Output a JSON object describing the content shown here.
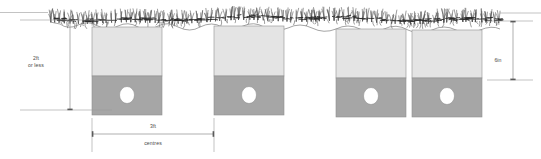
{
  "diagram": {
    "canvas": {
      "width": 541,
      "height": 159,
      "background": "#ffffff"
    },
    "colors": {
      "block_upper": "#e4e4e4",
      "block_lower": "#a6a6a6",
      "bore_fill": "#ffffff",
      "outline": "#8f8f8f",
      "dimension_line": "#8c8c8c",
      "tick": "#5a5a5a",
      "label_text": "#4a4a4a",
      "hedge_light": "#4d4d4d",
      "hedge_dark": "#2b2b2b",
      "ground_line": "#7d7d7d"
    },
    "dimensions": [
      {
        "id": "height-left",
        "label_line_1": "2ft",
        "label_line_2": "or less",
        "orientation": "vertical",
        "x": 70,
        "y_top": 20,
        "y_bottom": 110,
        "label_x": 36,
        "label_y": 60,
        "ext_top": {
          "x1": 20,
          "x2": 112,
          "y": 20
        },
        "ext_bottom": {
          "x1": 20,
          "x2": 112,
          "y": 110
        }
      },
      {
        "id": "spacing-bottom",
        "label_line_1": "3ft",
        "label_line_2": "centres",
        "orientation": "horizontal",
        "y": 134,
        "x_left": 92,
        "x_right": 214,
        "label_x": 153,
        "label_y": 128,
        "sublabel_x": 153,
        "sublabel_y": 145,
        "ext_left": {
          "y1": 118,
          "y2": 152,
          "x": 92
        },
        "ext_right": {
          "y1": 118,
          "y2": 152,
          "x": 214
        }
      },
      {
        "id": "depth-right",
        "label_line_1": "6in",
        "label_line_2": "",
        "orientation": "vertical",
        "x": 513,
        "y_top": 21,
        "y_bottom": 80,
        "label_x": 498,
        "label_y": 62,
        "ext_top": {
          "x1": 487,
          "x2": 533,
          "y": 21
        },
        "ext_bottom": {
          "x1": 487,
          "x2": 533,
          "y": 80
        }
      }
    ],
    "blocks": [
      {
        "id": "stake-block-1",
        "x": 92,
        "width": 70,
        "upper_top": 27,
        "divider_y": 76,
        "bottom_y": 115,
        "bore_cx": 127,
        "bore_cy": 95,
        "bore_rx": 7.5,
        "bore_ry": 8.5
      },
      {
        "id": "stake-block-2",
        "x": 214,
        "width": 70,
        "upper_top": 26,
        "divider_y": 76,
        "bottom_y": 115,
        "bore_cx": 249,
        "bore_cy": 95,
        "bore_rx": 7.5,
        "bore_ry": 8.5
      },
      {
        "id": "stake-block-3",
        "x": 336,
        "width": 70,
        "upper_top": 29,
        "divider_y": 78,
        "bottom_y": 117,
        "bore_cx": 371,
        "bore_cy": 96,
        "bore_rx": 7.5,
        "bore_ry": 8.5
      },
      {
        "id": "stake-block-4",
        "x": 412,
        "width": 70,
        "upper_top": 30,
        "divider_y": 78,
        "bottom_y": 117,
        "bore_cx": 447,
        "bore_cy": 96,
        "bore_rx": 7.5,
        "bore_ry": 8.5
      }
    ],
    "ground": {
      "id": "ground-surface",
      "path": "M 50 22 L 60 24 Q 68 30 78 25 Q 88 20 98 26 Q 108 32 118 26 Q 128 21 138 27 Q 148 32 158 26 Q 168 21 178 27 Q 190 33 200 27 Q 212 21 222 27 Q 232 32 243 26 Q 254 21 264 27 Q 276 33 288 28 Q 300 22 312 28 Q 324 34 336 29 Q 348 23 360 29 Q 372 35 384 29 Q 396 23 408 30 Q 420 36 432 30 Q 444 24 456 30 Q 468 36 480 30 Q 492 25 500 29"
    },
    "hedge": {
      "id": "hedge-row",
      "baseline_y": 16,
      "x_start": 48,
      "x_end": 502,
      "tuft_count": 96,
      "description": "dense brushwood / laid hedge texture"
    },
    "top_rule": {
      "x1": 0,
      "x2": 541,
      "y": 12
    }
  }
}
